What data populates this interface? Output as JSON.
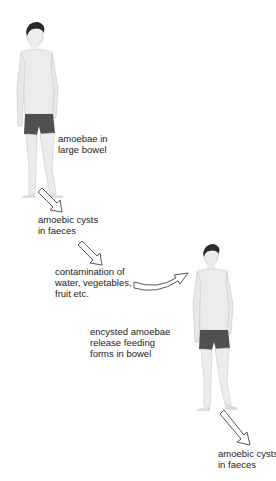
{
  "diagram": {
    "figures": [
      {
        "id": "man-1",
        "role": "infected host"
      },
      {
        "id": "man-2",
        "role": "new host"
      }
    ],
    "labels": {
      "amoebae_bowel": "amoebae in\nlarge bowel",
      "cysts_faeces_1": "amoebic cysts\nin faeces",
      "contamination": "contamination of\nwater, vegetables,\nfruit etc.",
      "encysted": "encysted amoebae\nrelease feeding\nforms in bowel",
      "cysts_faeces_2": "amoebic cysts\nin faeces"
    },
    "colors": {
      "skin": "#ececec",
      "skin_outline": "#bdbdbd",
      "hair": "#2a2a2a",
      "shorts": "#505050",
      "arrow_stroke": "#444444",
      "text": "#222222"
    }
  }
}
